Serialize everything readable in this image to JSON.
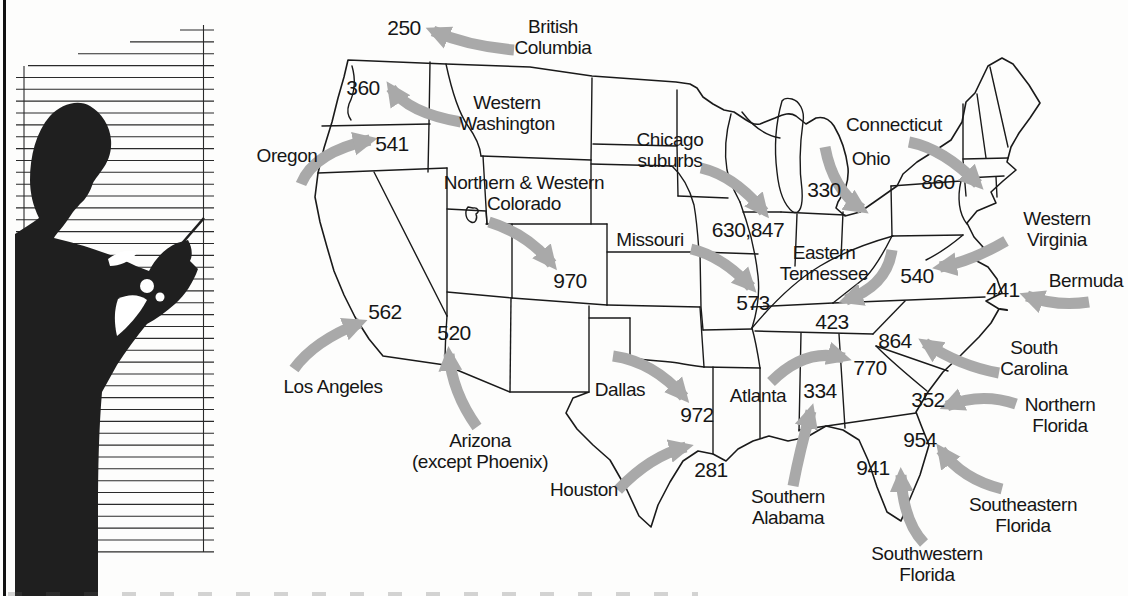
{
  "figure_title": "US map of new telephone area codes",
  "colors": {
    "background": "#fdfdfc",
    "line": "#1a1a1a",
    "arrow": "#a9a9a9",
    "silhouette": "#1f1f1f",
    "text": "#161616"
  },
  "chart_data": {
    "type": "table",
    "columns": [
      "region",
      "area_code"
    ],
    "rows": [
      [
        "British Columbia",
        "250"
      ],
      [
        "Western Washington",
        "360"
      ],
      [
        "Oregon",
        "541"
      ],
      [
        "Northern & Western Colorado",
        "970"
      ],
      [
        "Los Angeles",
        "562"
      ],
      [
        "Arizona (except Phoenix)",
        "520"
      ],
      [
        "Dallas",
        "972"
      ],
      [
        "Houston",
        "281"
      ],
      [
        "Chicago suburbs",
        "630,847"
      ],
      [
        "Ohio",
        "330"
      ],
      [
        "Connecticut",
        "860"
      ],
      [
        "Missouri",
        "573"
      ],
      [
        "Eastern Tennessee",
        "423"
      ],
      [
        "Western Virginia",
        "540"
      ],
      [
        "Bermuda",
        "441"
      ],
      [
        "South Carolina",
        "864"
      ],
      [
        "Atlanta",
        "770"
      ],
      [
        "Southern Alabama",
        "334"
      ],
      [
        "Northern Florida",
        "352"
      ],
      [
        "Southeastern Florida",
        "954"
      ],
      [
        "Southwestern Florida",
        "941"
      ]
    ]
  },
  "callouts": [
    {
      "name": "british-columbia",
      "label": "British\nColumbia",
      "code": "250"
    },
    {
      "name": "western-washington",
      "label": "Western\nWashington",
      "code": "360"
    },
    {
      "name": "oregon",
      "label": "Oregon",
      "code": "541"
    },
    {
      "name": "colorado",
      "label": "Northern & Western\nColorado",
      "code": "970"
    },
    {
      "name": "los-angeles",
      "label": "Los Angeles",
      "code": "562"
    },
    {
      "name": "arizona",
      "label": "Arizona\n(except Phoenix)",
      "code": "520"
    },
    {
      "name": "dallas",
      "label": "Dallas",
      "code": "972"
    },
    {
      "name": "houston",
      "label": "Houston",
      "code": "281"
    },
    {
      "name": "chicago-suburbs",
      "label": "Chicago\nsuburbs",
      "code": "630,847"
    },
    {
      "name": "ohio",
      "label": "Ohio",
      "code": "330"
    },
    {
      "name": "connecticut",
      "label": "Connecticut",
      "code": "860"
    },
    {
      "name": "missouri",
      "label": "Missouri",
      "code": "573"
    },
    {
      "name": "eastern-tennessee",
      "label": "Eastern\nTennessee",
      "code": "423"
    },
    {
      "name": "western-virginia",
      "label": "Western\nVirginia",
      "code": "540"
    },
    {
      "name": "bermuda",
      "label": "Bermuda",
      "code": "441"
    },
    {
      "name": "south-carolina",
      "label": "South\nCarolina",
      "code": "864"
    },
    {
      "name": "atlanta",
      "label": "Atlanta",
      "code": "770"
    },
    {
      "name": "southern-alabama",
      "label": "Southern\nAlabama",
      "code": "334"
    },
    {
      "name": "northern-florida",
      "label": "Northern\nFlorida",
      "code": "352"
    },
    {
      "name": "southeastern-florida",
      "label": "Southeastern\nFlorida",
      "code": "954"
    },
    {
      "name": "southwestern-florida",
      "label": "Southwestern\nFlorida",
      "code": "941"
    }
  ]
}
